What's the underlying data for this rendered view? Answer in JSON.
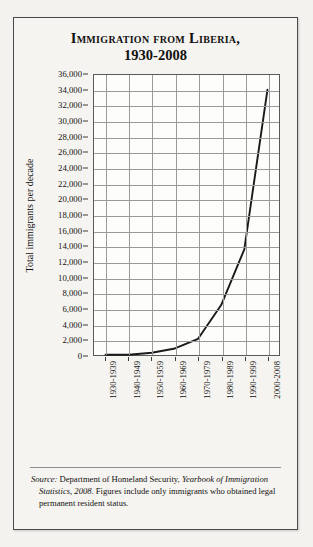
{
  "figure": {
    "title_line1": "Immigration from Liberia,",
    "title_line2": "1930-2008",
    "source_label": "Source:",
    "source_text_1": " Department of Homeland Security, ",
    "source_italic_1": "Yearbook of Immigration Statistics, 2008",
    "source_text_2": ". Figures include only immigrants who obtained legal permanent resident status."
  },
  "chart_data": {
    "type": "line",
    "title": "Immigration from Liberia, 1930-2008",
    "xlabel": "",
    "ylabel": "Total immigrants per decade",
    "categories": [
      "1930-1939",
      "1940-1949",
      "1950-1959",
      "1960-1969",
      "1970-1979",
      "1980-1989",
      "1990-1999",
      "2000-2008"
    ],
    "values": [
      35,
      37,
      289,
      841,
      2081,
      6420,
      13587,
      34100
    ],
    "ylim": [
      0,
      36000
    ],
    "ytick_step": 2000,
    "yticks": [
      "0",
      "2,000",
      "4,000",
      "6,000",
      "8,000",
      "10,000",
      "12,000",
      "14,000",
      "16,000",
      "18,000",
      "20,000",
      "22,000",
      "24,000",
      "26,000",
      "28,000",
      "30,000",
      "32,000",
      "34,000",
      "36,000"
    ],
    "grid": true,
    "legend": "none",
    "line_color": "#1a1a1a"
  }
}
